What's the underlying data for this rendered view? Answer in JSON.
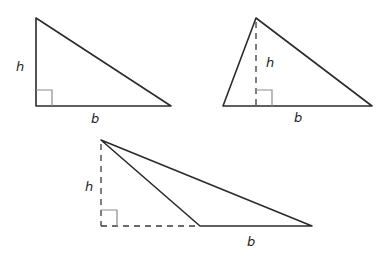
{
  "diagram": {
    "colors": {
      "edge": "#2b2b2b",
      "dashed": "#3a3a3a",
      "right_angle_marker": "#8c8c8c",
      "label": "#1f1f1f",
      "background": "#ffffff"
    },
    "triangles": [
      {
        "type": "right",
        "height_label": "h",
        "base_label": "b"
      },
      {
        "type": "acute",
        "height_label": "h",
        "base_label": "b"
      },
      {
        "type": "obtuse",
        "height_label": "h",
        "base_label": "b"
      }
    ]
  }
}
